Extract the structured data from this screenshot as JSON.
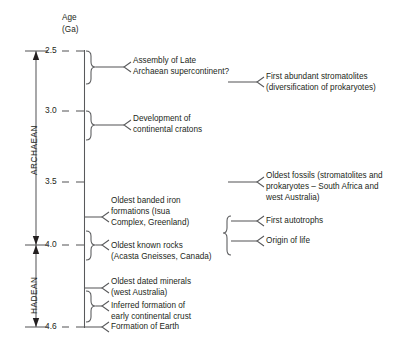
{
  "figure": {
    "axis_title_line1": "Age",
    "axis_title_line2": "(Ga)"
  },
  "axis": {
    "unit": "Ga",
    "ticks": [
      {
        "value": "2.5",
        "y": 51
      },
      {
        "value": "3.0",
        "y": 111
      },
      {
        "value": "3.5",
        "y": 182
      },
      {
        "value": "4.0",
        "y": 245
      },
      {
        "value": "4.6",
        "y": 327
      }
    ],
    "range_top": "2.5",
    "range_bottom": "4.6"
  },
  "eras": [
    {
      "name": "ARCHAEAN",
      "top": "2.5",
      "bottom": "4.0"
    },
    {
      "name": "HADEAN",
      "top": "4.0",
      "bottom": "4.6"
    }
  ],
  "left_events": [
    {
      "lines": [
        "Assembly of Late",
        "Archaean supercontinent?"
      ],
      "connector": "brace"
    },
    {
      "lines": [
        "Development of",
        "continental cratons"
      ],
      "connector": "brace"
    },
    {
      "lines": [
        "Oldest banded iron",
        "formations (Isua",
        "Complex, Greenland)"
      ],
      "connector": "line"
    },
    {
      "lines": [
        "Oldest known rocks",
        "(Acasta Gneisses, Canada)"
      ],
      "connector": "brace"
    },
    {
      "lines": [
        "Oldest dated minerals",
        "(west Australia)"
      ],
      "connector": "line"
    },
    {
      "lines": [
        "Inferred formation of",
        "early continental crust"
      ],
      "connector": "brace"
    },
    {
      "lines": [
        "Formation of Earth"
      ],
      "connector": "line"
    }
  ],
  "right_events": [
    {
      "lines": [
        "First abundant stromatolites",
        "(diversification of prokaryotes)"
      ],
      "connector": "line"
    },
    {
      "lines": [
        "Oldest fossils (stromatolites and",
        "prokaryotes – South Africa and",
        "west Australia)"
      ],
      "connector": "line"
    },
    {
      "lines": [
        "First autotrophs"
      ],
      "connector": "brace-branch"
    },
    {
      "lines": [
        "Origin of life"
      ],
      "connector": "brace-branch"
    }
  ],
  "colors": {
    "stroke": "#58595b",
    "text": "#231f20",
    "background": "#ffffff"
  }
}
